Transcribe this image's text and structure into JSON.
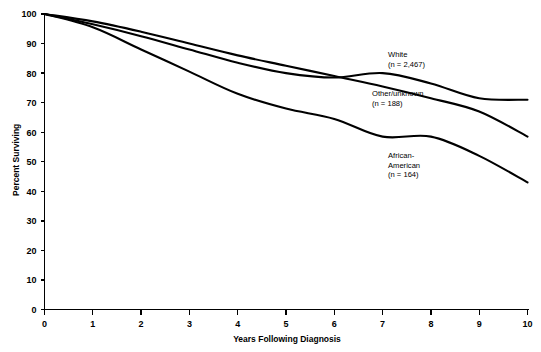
{
  "chart_data": {
    "type": "line",
    "title": "",
    "xlabel": "Years Following Diagnosis",
    "ylabel": "Percent Surviving",
    "x": [
      0,
      1,
      2,
      3,
      4,
      5,
      6,
      7,
      8,
      9,
      10
    ],
    "xlim": [
      0,
      10
    ],
    "ylim": [
      0,
      100
    ],
    "xticks": [
      "0",
      "1",
      "2",
      "3",
      "4",
      "5",
      "6",
      "7",
      "8",
      "9",
      "10"
    ],
    "yticks": [
      "0",
      "10",
      "20",
      "30",
      "40",
      "50",
      "60",
      "70",
      "80",
      "90",
      "100"
    ],
    "grid": false,
    "legend_position": "inline-annotations",
    "line_color": "#000000",
    "series": [
      {
        "name": "White",
        "n_label": "(n = 2,467)",
        "values": [
          100,
          97.5,
          94,
          90,
          86,
          82.5,
          79,
          75.5,
          71.5,
          67,
          58.5
        ],
        "annotation_x": 10.0,
        "annotation_y": 58.5
      },
      {
        "name": "Other/unknown",
        "n_label": "(n = 188)",
        "values": [
          100,
          96.5,
          92.5,
          88,
          83.5,
          80,
          78.5,
          80,
          76.5,
          71.5,
          71
        ],
        "annotation_x": 10.0,
        "annotation_y": 71
      },
      {
        "name": "African-American",
        "n_label": "(n = 164)",
        "values": [
          100,
          95.5,
          88,
          80.5,
          73,
          68,
          64.5,
          58.5,
          58.5,
          52,
          43
        ],
        "annotation_x": 10.0,
        "annotation_y": 43
      }
    ],
    "annotations": [
      {
        "id": "white",
        "line1": "White",
        "line2": "(n = 2,467)",
        "px": 388,
        "py": 57
      },
      {
        "id": "other",
        "line1": "Other/unknown",
        "line2": "(n = 188)",
        "px": 372,
        "py": 96
      },
      {
        "id": "african-american",
        "line1": "African-",
        "line2": "American",
        "line3": "(n = 164)",
        "px": 388,
        "py": 158
      }
    ]
  }
}
